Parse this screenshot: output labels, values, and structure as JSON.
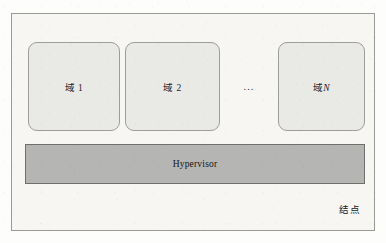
{
  "figure": {
    "type": "block-diagram",
    "node": {
      "caption": "结点"
    },
    "domains": [
      {
        "label_prefix": "域 ",
        "index": "1"
      },
      {
        "label_prefix": "域 ",
        "index": "2"
      },
      {
        "label_prefix": "域",
        "index": "N"
      }
    ],
    "ellipsis": "...",
    "hypervisor": {
      "label": "Hypervisor"
    },
    "colors": {
      "page_background": "#fdfdfc",
      "node_background": "#f7f6f3",
      "node_border": "#9a9a96",
      "domain_fill": "#e9e9e6",
      "domain_border": "#9d9d99",
      "hypervisor_fill": "#b5b5b3",
      "hypervisor_border": "#6f6f6b",
      "text": "#1c1c1c"
    }
  }
}
